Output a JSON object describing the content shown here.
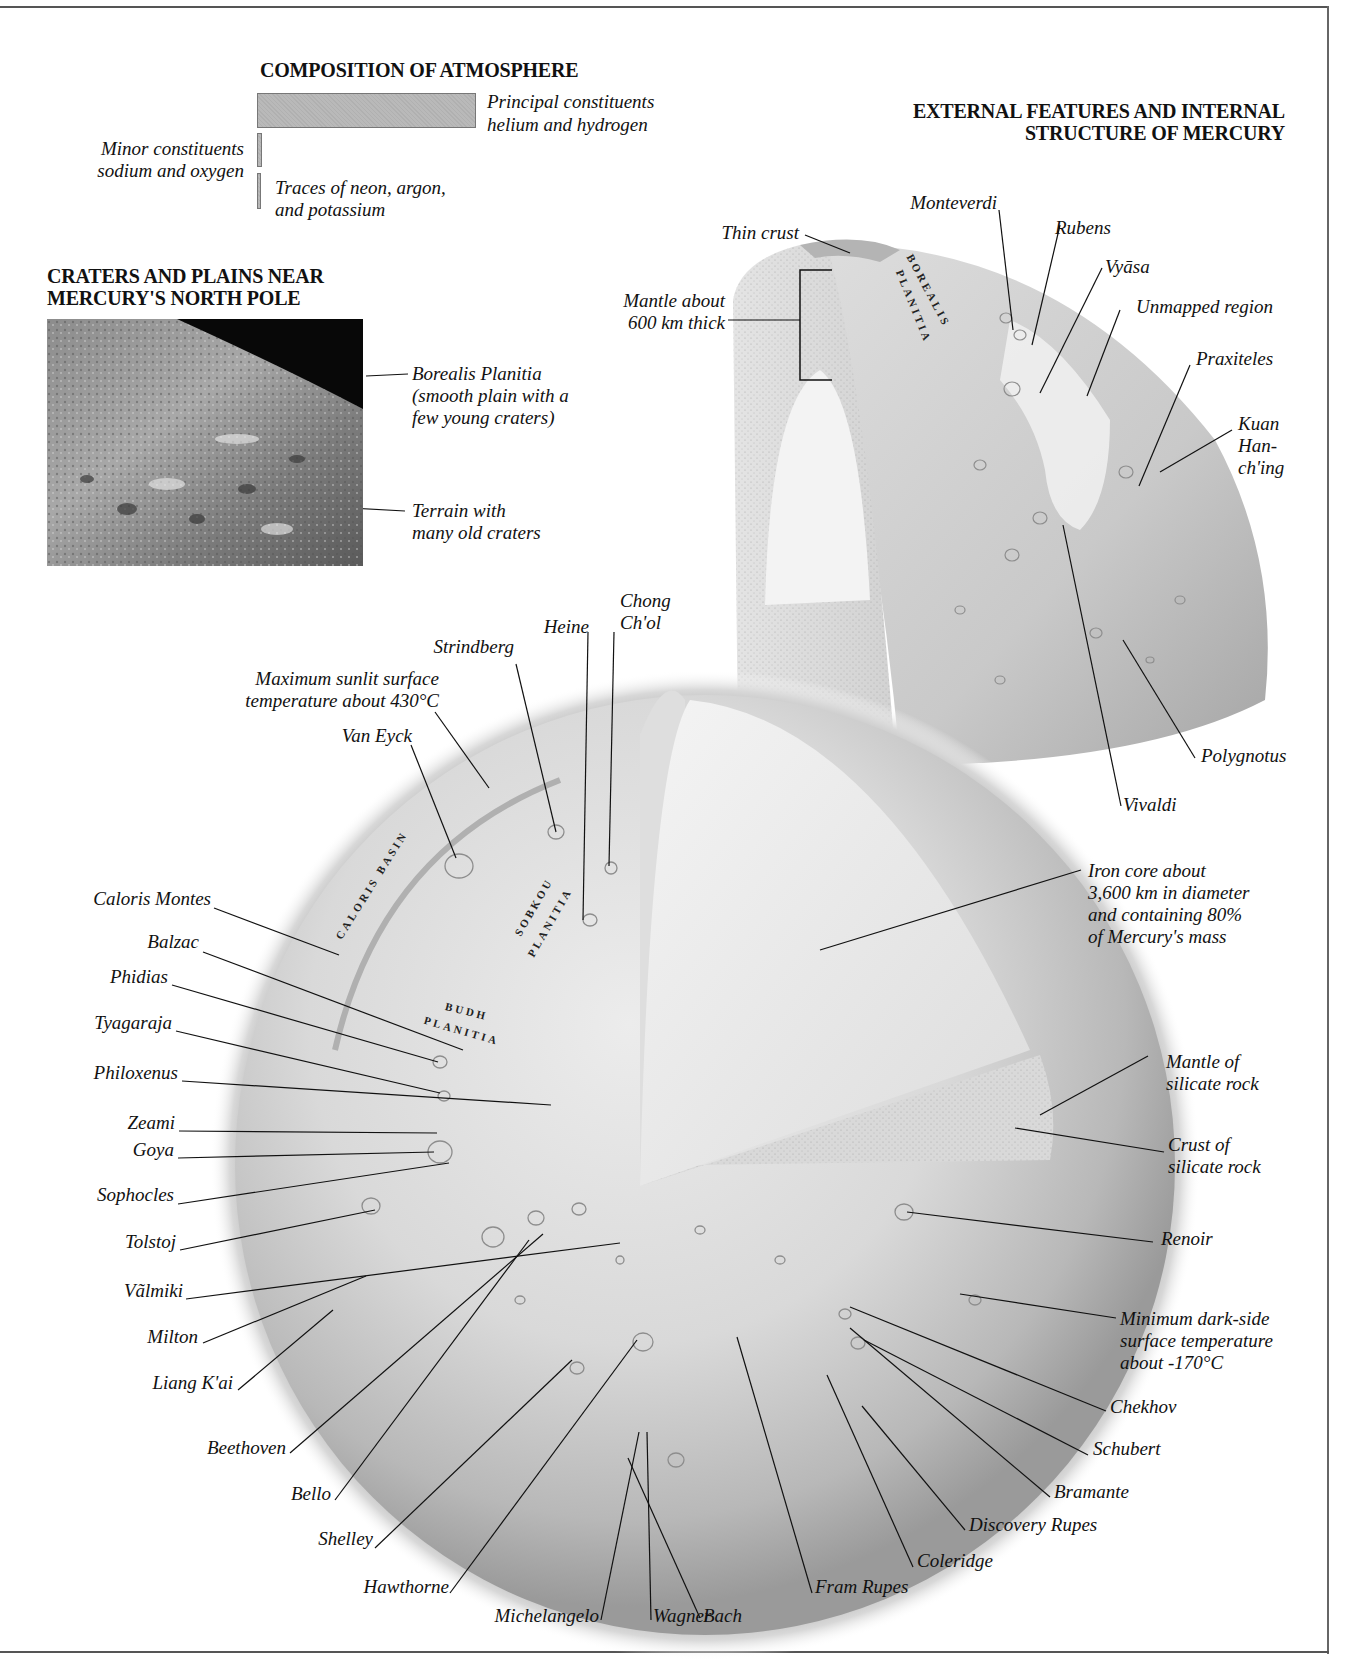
{
  "title": {
    "main_line1": "EXTERNAL FEATURES AND INTERNAL",
    "main_line2": "STRUCTURE OF MERCURY"
  },
  "atmosphere": {
    "heading": "COMPOSITION OF ATMOSPHERE",
    "principal_line1": "Principal constituents",
    "principal_line2": "helium and hydrogen",
    "minor_line1": "Minor constituents",
    "minor_line2": "sodium and oxygen",
    "traces_line1": "Traces of neon, argon,",
    "traces_line2": "and potassium",
    "bar_color": "#b9b9b9"
  },
  "north_pole": {
    "heading_line1": "CRATERS AND PLAINS NEAR",
    "heading_line2": "MERCURY'S NORTH POLE",
    "borealis_line1": "Borealis Planitia",
    "borealis_line2": "(smooth plain with a",
    "borealis_line3": "few young craters)",
    "terrain_line1": "Terrain with",
    "terrain_line2": "many old craters"
  },
  "hemisphere": {
    "thin_crust": "Thin crust",
    "mantle_line1": "Mantle about",
    "mantle_line2": "600 km thick",
    "region_borealis": "BOREALIS",
    "region_planitia": "PLANITIA",
    "features": {
      "monteverdi": "Monteverdi",
      "rubens": "Rubens",
      "vyasa": "Vyāsa",
      "unmapped": "Unmapped region",
      "praxiteles": "Praxiteles",
      "kuan_line1": "Kuan",
      "kuan_line2": "Han-",
      "kuan_line3": "ch'ing",
      "polygnotus": "Polygnotus",
      "vivaldi": "Vivaldi"
    }
  },
  "globe": {
    "regions": {
      "caloris_basin": "CALORIS BASIN",
      "sobkou": "SOBKOU",
      "sobkou_planitia": "PLANITIA",
      "budh": "BUDH",
      "budh_planitia": "PLANITIA"
    },
    "top_labels": {
      "chong_line1": "Chong",
      "chong_line2": "Ch'ol",
      "heine": "Heine",
      "strindberg": "Strindberg",
      "max_temp_line1": "Maximum sunlit surface",
      "max_temp_line2": "temperature about 430°C",
      "van_eyck": "Van Eyck"
    },
    "left_labels": [
      "Caloris Montes",
      "Balzac",
      "Phidias",
      "Tyagaraja",
      "Philoxenus",
      "Zeami",
      "Goya",
      "Sophocles",
      "Tolstoj",
      "Vãlmiki",
      "Milton",
      "Liang K'ai"
    ],
    "bottom_labels": [
      "Beethoven",
      "Bello",
      "Shelley",
      "Hawthorne",
      "Michelangelo",
      "Wagner",
      "Bach",
      "Fram Rupes",
      "Coleridge",
      "Discovery Rupes",
      "Bramante",
      "Schubert",
      "Chekhov"
    ],
    "right_labels": {
      "core_line1": "Iron core about",
      "core_line2": "3,600 km in diameter",
      "core_line3": "and containing 80%",
      "core_line4": "of Mercury's mass",
      "mantle_line1": "Mantle of",
      "mantle_line2": "silicate rock",
      "crust_line1": "Crust of",
      "crust_line2": "silicate rock",
      "renoir": "Renoir",
      "min_temp_line1": "Minimum dark-side",
      "min_temp_line2": "surface temperature",
      "min_temp_line3": "about -170°C"
    }
  }
}
